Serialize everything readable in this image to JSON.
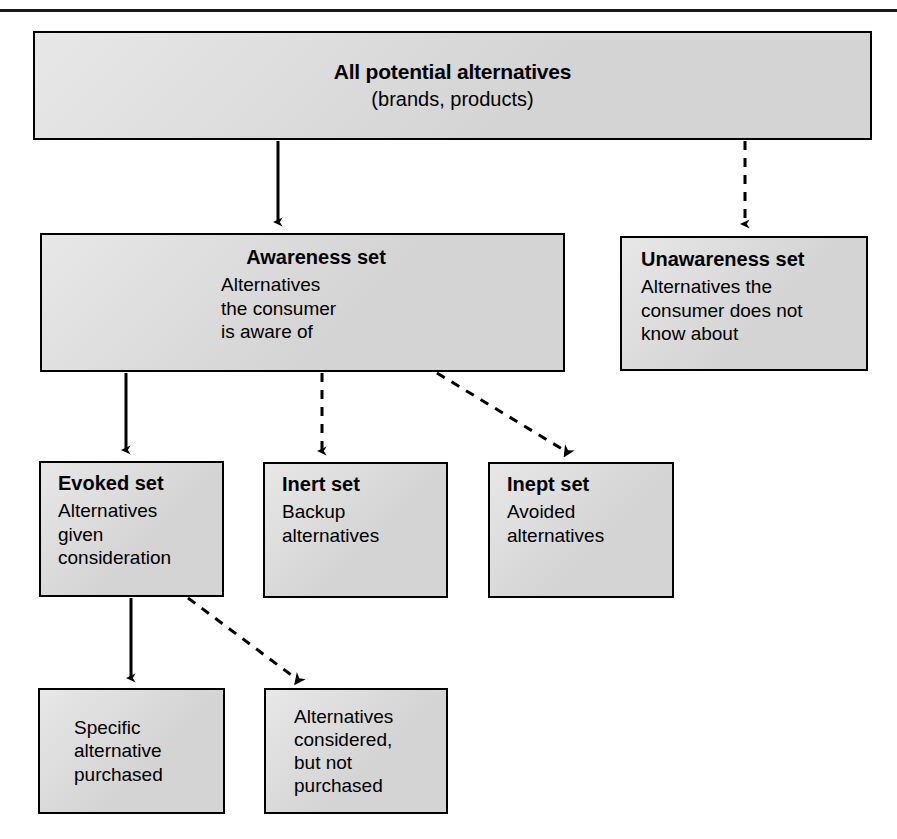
{
  "figure": {
    "kind": "flow-diagram",
    "topic": "Consumer alternative sets",
    "box_fill": "#d4d4d4",
    "line_color": "#000000"
  },
  "nodes": {
    "all_potential": {
      "title": "All potential alternatives",
      "body": "(brands, products)"
    },
    "awareness": {
      "title": "Awareness set",
      "body": "Alternatives\nthe consumer\nis aware of"
    },
    "unawareness": {
      "title": "Unawareness set",
      "body": "Alternatives the\nconsumer does not\nknow about"
    },
    "evoked": {
      "title": "Evoked set",
      "body": "Alternatives\ngiven\nconsideration"
    },
    "inert": {
      "title": "Inert set",
      "body": "Backup\nalternatives"
    },
    "inept": {
      "title": "Inept set",
      "body": "Avoided\nalternatives"
    },
    "purchased": {
      "title": "",
      "body": "Specific\nalternative\npurchased"
    },
    "not_purchased": {
      "title": "",
      "body": "Alternatives\nconsidered,\nbut not\npurchased"
    }
  },
  "connectors": [
    {
      "id": "all-to-awareness",
      "style": "solid",
      "from": "all_potential",
      "to": "awareness"
    },
    {
      "id": "all-to-unawareness",
      "style": "dashed",
      "from": "all_potential",
      "to": "unawareness"
    },
    {
      "id": "awareness-to-evoked",
      "style": "solid",
      "from": "awareness",
      "to": "evoked"
    },
    {
      "id": "awareness-to-inert",
      "style": "dashed",
      "from": "awareness",
      "to": "inert"
    },
    {
      "id": "awareness-to-inept",
      "style": "dashed",
      "from": "awareness",
      "to": "inept"
    },
    {
      "id": "evoked-to-purchased",
      "style": "solid",
      "from": "evoked",
      "to": "purchased"
    },
    {
      "id": "evoked-to-notpurchased",
      "style": "dashed",
      "from": "evoked",
      "to": "not_purchased"
    }
  ]
}
